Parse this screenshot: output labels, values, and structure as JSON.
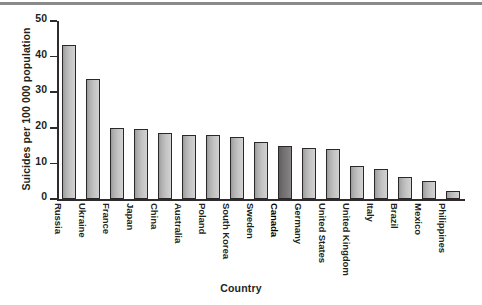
{
  "chart_data": {
    "type": "bar",
    "title": "",
    "xlabel": "Country",
    "ylabel": "Suicides per 100 000 population",
    "ylim": [
      0,
      50
    ],
    "yticks": [
      0,
      10,
      20,
      30,
      40,
      50
    ],
    "grid": false,
    "legend": null,
    "highlight_category": "Canada",
    "categories": [
      "Russia",
      "Ukraine",
      "France",
      "Japan",
      "China",
      "Australia",
      "Poland",
      "South Korea",
      "Sweden",
      "Canada",
      "Germany",
      "United States",
      "United Kingdom",
      "Italy",
      "Brazil",
      "Mexico",
      "Philippines"
    ],
    "values": [
      43.2,
      33.8,
      20.0,
      19.6,
      18.6,
      18.1,
      18.1,
      17.3,
      16.0,
      15.0,
      14.4,
      14.0,
      9.3,
      8.5,
      6.3,
      5.2,
      2.2
    ]
  },
  "colors": {
    "bar_fill_light": "#c2c2c2",
    "bar_fill_dark": "#6d6b6c",
    "bar_outline": "#2b2829",
    "axis": "#2f2b2c",
    "text": "#231f20",
    "top_rule": "#8a8a8a",
    "background": "#ffffff"
  }
}
